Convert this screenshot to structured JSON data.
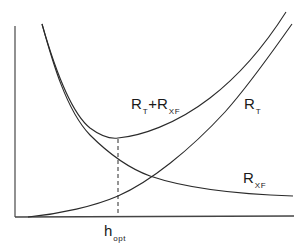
{
  "diagram": {
    "labels": {
      "sum_curve": {
        "main": "R",
        "sub1": "T",
        "plus": "+",
        "main2": "R",
        "sub2": "XF"
      },
      "rt_curve": {
        "main": "R",
        "sub": "T"
      },
      "rxf_curve": {
        "main": "R",
        "sub": "XF"
      },
      "x_marker": {
        "main": "h",
        "sub": "opt"
      }
    },
    "curves": [
      {
        "name": "R_T + R_XF",
        "shape": "U-shaped (decreasing, minimum at h_opt, then increasing)"
      },
      {
        "name": "R_T",
        "shape": "monotonic increasing from origin"
      },
      {
        "name": "R_XF",
        "shape": "monotonic decreasing hyperbola-like"
      }
    ],
    "marker": {
      "type": "dashed vertical line",
      "at": "h_opt",
      "from": "minimum of R_T + R_XF",
      "to": "x-axis"
    },
    "colors": {
      "line": "#2a2a2a",
      "axis": "#555555",
      "background": "#ffffff"
    }
  }
}
